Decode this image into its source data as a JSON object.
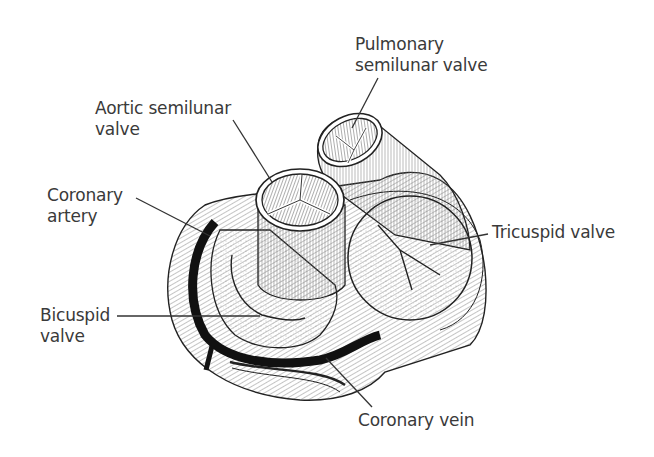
{
  "diagram": {
    "style": "black-and-white pen illustration",
    "colors": {
      "background": "#ffffff",
      "label_text": "#3a3a3a",
      "leader_line": "#333333",
      "ink": "#1a1a1a"
    }
  },
  "labels": {
    "pulmonary": {
      "line1": "Pulmonary",
      "line2": "semilunar valve"
    },
    "aortic": {
      "line1": "Aortic semilunar",
      "line2": "valve"
    },
    "coronary_artery": {
      "line1": "Coronary",
      "line2": "artery"
    },
    "bicuspid": {
      "line1": "Bicuspid",
      "line2": "valve"
    },
    "tricuspid": {
      "line1": "Tricuspid valve"
    },
    "coronary_vein": {
      "line1": "Coronary vein"
    }
  }
}
